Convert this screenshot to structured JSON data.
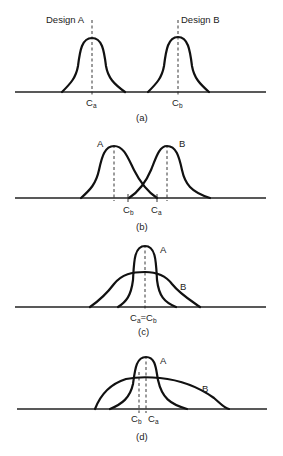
{
  "figure": {
    "panels": [
      {
        "id": "a",
        "caption": "(a)",
        "curve_labels": [
          "Design A",
          "Design B"
        ],
        "markers": [
          {
            "main": "C",
            "sub": "a"
          },
          {
            "main": "C",
            "sub": "b"
          }
        ]
      },
      {
        "id": "b",
        "caption": "(b)",
        "curve_labels": [
          "A",
          "B"
        ],
        "markers": [
          {
            "main": "C",
            "sub": "b"
          },
          {
            "main": "C",
            "sub": "a"
          }
        ]
      },
      {
        "id": "c",
        "caption": "(c)",
        "curve_labels": [
          "A",
          "B"
        ],
        "markers": [
          {
            "main": "C",
            "sub": "a"
          },
          {
            "eq": "="
          },
          {
            "main": "C",
            "sub": "b"
          }
        ]
      },
      {
        "id": "d",
        "caption": "(d)",
        "curve_labels": [
          "A",
          "B"
        ],
        "markers": [
          {
            "main": "C",
            "sub": "b"
          },
          {
            "main": "C",
            "sub": "a"
          }
        ]
      }
    ]
  }
}
